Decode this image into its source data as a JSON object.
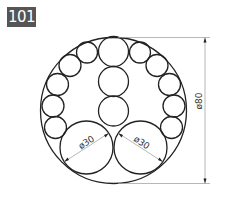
{
  "exercise_number": "101",
  "drawing": {
    "outer_circle": {
      "diameter": 80
    },
    "bottom_circles": [
      {
        "diameter": 30,
        "label": "ø30"
      },
      {
        "diameter": 30,
        "label": "ø30"
      }
    ],
    "center_column_count": 3,
    "ring_small_circles_per_side": 5,
    "dimensions": {
      "overall": "ø80",
      "left_big": "ø30",
      "right_big": "ø30"
    }
  },
  "colors": {
    "badge": "#555555",
    "line": "#222222",
    "dim": "#999999"
  }
}
